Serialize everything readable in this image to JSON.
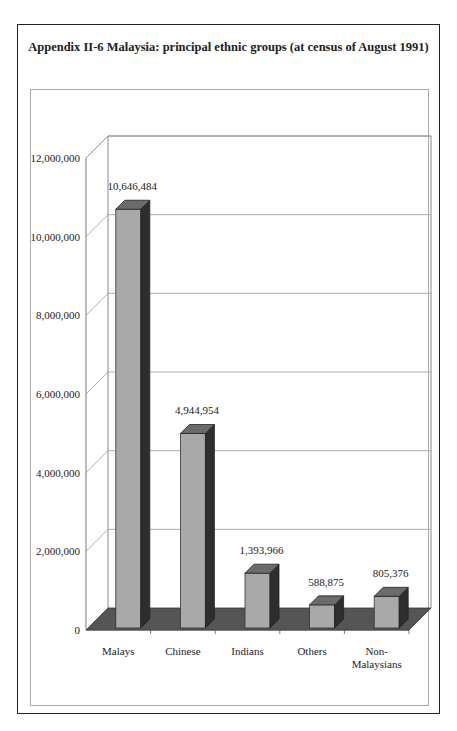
{
  "title": "Appendix II-6 Malaysia: principal ethnic groups (at census of August 1991)",
  "chart_data": {
    "type": "bar",
    "title": "Appendix II-6 Malaysia: principal ethnic groups (at census of August 1991)",
    "categories": [
      "Malays",
      "Chinese",
      "Indians",
      "Others",
      "Non-Malaysians"
    ],
    "values": [
      10646484,
      4944954,
      1393966,
      588875,
      805376
    ],
    "value_labels": [
      "10,646,484",
      "4,944,954",
      "1,393,966",
      "588,875",
      "805,376"
    ],
    "xlabel": "",
    "ylabel": "",
    "ylim": [
      0,
      12000000
    ],
    "y_ticks": [
      0,
      2000000,
      4000000,
      6000000,
      8000000,
      10000000,
      12000000
    ],
    "y_tick_labels": [
      "0",
      "2,000,000",
      "4,000,000",
      "6,000,000",
      "8,000,000",
      "10,000,000",
      "12,000,000"
    ],
    "grid": true,
    "legend": "none",
    "style": "3d",
    "colors": {
      "bar_front": "#a9a9a9",
      "bar_side": "#2e2e2e",
      "bar_top": "#6b6b6b",
      "floor": "#555555"
    }
  },
  "x_labels": [
    {
      "line1": "Malays",
      "line2": ""
    },
    {
      "line1": "Chinese",
      "line2": ""
    },
    {
      "line1": "Indians",
      "line2": ""
    },
    {
      "line1": "Others",
      "line2": ""
    },
    {
      "line1": "Non-",
      "line2": "Malaysians"
    }
  ]
}
